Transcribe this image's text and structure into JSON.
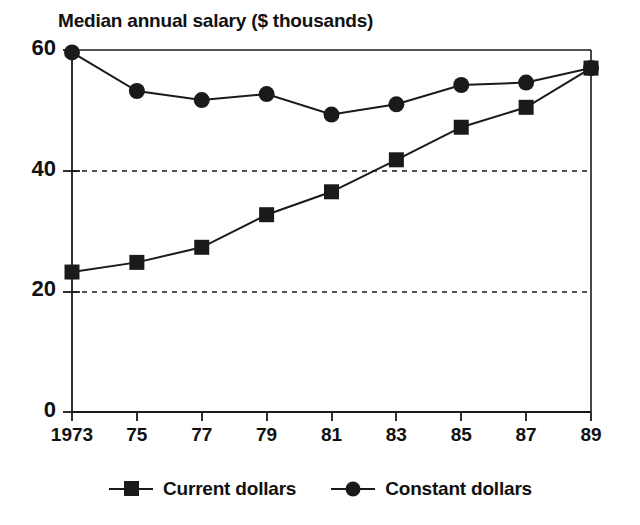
{
  "chart_data": {
    "type": "line",
    "title": "Median annual salary ($ thousands)",
    "xlabel": "",
    "ylabel": "",
    "x": [
      1973,
      1975,
      1977,
      1979,
      1981,
      1983,
      1985,
      1987,
      1989
    ],
    "categories": [
      "1973",
      "75",
      "77",
      "79",
      "81",
      "83",
      "85",
      "87",
      "89"
    ],
    "series": [
      {
        "name": "Current dollars",
        "marker": "square",
        "color": "#1a1a1a",
        "values": [
          23.2,
          24.8,
          27.3,
          32.7,
          36.5,
          41.8,
          47.2,
          50.5,
          57.0
        ]
      },
      {
        "name": "Constant dollars",
        "marker": "circle",
        "color": "#1a1a1a",
        "values": [
          59.6,
          53.2,
          51.7,
          52.7,
          49.3,
          51.0,
          54.2,
          54.6,
          57.0
        ]
      }
    ],
    "ylim": [
      0,
      60
    ],
    "xlim": [
      1973,
      1989
    ],
    "yticks": [
      0,
      20,
      40,
      60
    ],
    "ytick_labels": [
      "0",
      "20",
      "40",
      "60"
    ],
    "gridlines": {
      "y": [
        20,
        40
      ],
      "style": "dashed"
    },
    "grid": true,
    "legend_position": "bottom-center"
  },
  "legend": {
    "entries": [
      {
        "label": "Current dollars",
        "marker": "square"
      },
      {
        "label": "Constant dollars",
        "marker": "circle"
      }
    ]
  }
}
